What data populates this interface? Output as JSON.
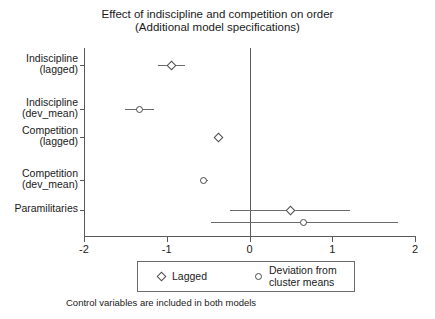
{
  "chart_data": {
    "type": "scatter",
    "plot_style": "coefficient-plot",
    "title": "Effect of indiscipline and competition on order",
    "subtitle": "(Additional model specifications)",
    "caption": "Control variables are included in both models",
    "xlabel": "",
    "ylabel": "",
    "xlim": [
      -2,
      2
    ],
    "xticks": [
      -2,
      -1,
      0,
      1,
      2
    ],
    "xticklabels": [
      "-2",
      "-1",
      "0",
      "1",
      "2"
    ],
    "grid": false,
    "reference_line": 0,
    "legend_position": "bottom",
    "categories": [
      "Indiscipline\n(lagged)",
      "Indiscipline\n(dev_mean)",
      "Competition\n(lagged)",
      "Competition\n(dev_mean)",
      "Paramilitaries"
    ],
    "category_lines": [
      [
        "Indiscipline",
        "(lagged)"
      ],
      [
        "Indiscipline",
        "(dev_mean)"
      ],
      [
        "Competition",
        "(lagged)"
      ],
      [
        "Competition",
        "(dev_mean)"
      ],
      [
        "Paramilitaries"
      ]
    ],
    "series": [
      {
        "name": "Lagged",
        "marker": "diamond",
        "points": [
          {
            "category": "Indiscipline (lagged)",
            "estimate": -0.94,
            "ci_low": -1.11,
            "ci_high": -0.78
          },
          {
            "category": "Competition (lagged)",
            "estimate": -0.38,
            "ci_low": -0.43,
            "ci_high": -0.33
          },
          {
            "category": "Paramilitaries",
            "estimate": 0.49,
            "ci_low": -0.24,
            "ci_high": 1.22
          }
        ]
      },
      {
        "name": "Deviation from cluster means",
        "marker": "circle",
        "points": [
          {
            "category": "Indiscipline (dev_mean)",
            "estimate": -1.33,
            "ci_low": -1.5,
            "ci_high": -1.16
          },
          {
            "category": "Competition (dev_mean)",
            "estimate": -0.55,
            "ci_low": -0.6,
            "ci_high": -0.5
          },
          {
            "category": "Paramilitaries",
            "estimate": 0.65,
            "ci_low": -0.46,
            "ci_high": 1.8
          }
        ]
      }
    ]
  },
  "title": {
    "line1": "Effect of indiscipline and competition on order",
    "line2": "(Additional model specifications)"
  },
  "legend": {
    "entries": [
      {
        "label": "Lagged",
        "marker": "diamond"
      },
      {
        "label": "Deviation from\ncluster means",
        "marker": "circle"
      }
    ]
  },
  "caption": "Control variables are included in both models",
  "colors": {
    "marker": "#4a4a4a",
    "line": "#6b6b6b",
    "axis": "#5a5a5a",
    "text": "#1a1a1a",
    "background": "#ffffff"
  }
}
